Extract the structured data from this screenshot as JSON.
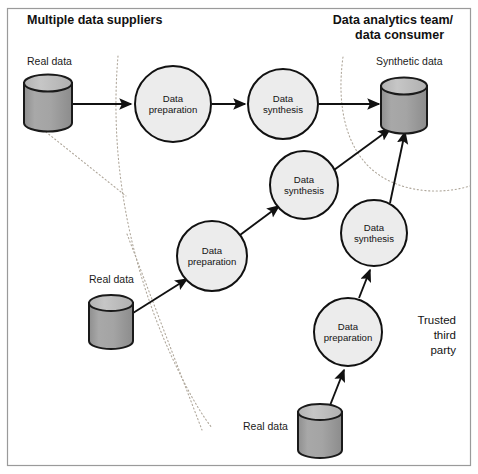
{
  "figure": {
    "title_left": "Multiple data suppliers",
    "title_right_line1": "Data analytics team/",
    "title_right_line2": "data consumer",
    "trusted_party_line1": "Trusted",
    "trusted_party_line2": "third",
    "trusted_party_line3": "party",
    "colors": {
      "border": "#9a9a9a",
      "stroke": "#111111",
      "circle_fill": "#ececec",
      "cylinder_top": "#bdbdbd",
      "cylinder_body": "#a2a2a2",
      "boundary_dotted": "#b0a89c",
      "background": "#ffffff"
    }
  },
  "datastores": [
    {
      "id": "real-data-top",
      "label": "Real data",
      "label_x": 27,
      "label_y": 65,
      "cx": 48,
      "cy_top": 83,
      "rx": 24,
      "ry": 8.5,
      "body_h": 40
    },
    {
      "id": "real-data-middle",
      "label": "Real data",
      "label_x": 89,
      "label_y": 283,
      "cx": 111,
      "cy_top": 303,
      "rx": 22,
      "ry": 8.0,
      "body_h": 38
    },
    {
      "id": "real-data-bottom",
      "label": "Real data",
      "label_x": 243,
      "label_y": 430,
      "cx": 320,
      "cy_top": 412,
      "rx": 22,
      "ry": 8.0,
      "body_h": 38
    },
    {
      "id": "synthetic-data",
      "label": "Synthetic data",
      "label_x": 376,
      "label_y": 65,
      "cx": 404,
      "cy_top": 86,
      "rx": 23,
      "ry": 8.5,
      "body_h": 39
    }
  ],
  "process_nodes": [
    {
      "id": "prep-1",
      "kind": "preparation",
      "line1": "Data",
      "line2": "preparation",
      "cx": 173,
      "cy": 104,
      "r": 38
    },
    {
      "id": "synth-1",
      "kind": "synthesis",
      "line1": "Data",
      "line2": "synthesis",
      "cx": 283,
      "cy": 104,
      "r": 35
    },
    {
      "id": "synth-2",
      "kind": "synthesis",
      "line1": "Data",
      "line2": "synthesis",
      "cx": 304,
      "cy": 185,
      "r": 34
    },
    {
      "id": "prep-2",
      "kind": "preparation",
      "line1": "Data",
      "line2": "preparation",
      "cx": 212,
      "cy": 256,
      "r": 35
    },
    {
      "id": "synth-3",
      "kind": "synthesis",
      "line1": "Data",
      "line2": "synthesis",
      "cx": 374,
      "cy": 233,
      "r": 33
    },
    {
      "id": "prep-3",
      "kind": "preparation",
      "line1": "Data",
      "line2": "preparation",
      "cx": 348,
      "cy": 332,
      "r": 34
    }
  ],
  "flow_arrows": [
    {
      "id": "arrow-realdata-top-to-prep1",
      "x1": 73,
      "y1": 104,
      "x2": 131,
      "y2": 104
    },
    {
      "id": "arrow-prep1-to-synth1",
      "x1": 212,
      "y1": 104,
      "x2": 245,
      "y2": 104
    },
    {
      "id": "arrow-synth1-to-synthetic",
      "x1": 319,
      "y1": 104,
      "x2": 379,
      "y2": 104
    },
    {
      "id": "arrow-realdata-mid-to-prep2",
      "x1": 133,
      "y1": 313,
      "x2": 187,
      "y2": 279
    },
    {
      "id": "arrow-prep2-to-synth2",
      "x1": 240,
      "y1": 235,
      "x2": 279,
      "y2": 205
    },
    {
      "id": "arrow-synth2-to-synthetic",
      "x1": 334,
      "y1": 170,
      "x2": 389,
      "y2": 128
    },
    {
      "id": "arrow-realdata-bot-to-prep3",
      "x1": 329,
      "y1": 406,
      "x2": 344,
      "y2": 369
    },
    {
      "id": "arrow-prep3-to-synth3",
      "x1": 359,
      "y1": 297,
      "x2": 370,
      "y2": 269
    },
    {
      "id": "arrow-synth3-to-synthetic",
      "x1": 389,
      "y1": 202,
      "x2": 404,
      "y2": 130
    }
  ],
  "boundaries": [
    {
      "id": "supplier-boundary-arc",
      "d": "M 118 56 C 110 150 124 265 184 382 C 194 402 203 416 212 428"
    },
    {
      "id": "supplier-divider-line",
      "d": "M 31 120 L 126 196"
    },
    {
      "id": "supplier-divider-line-2",
      "d": "M 127 234 L 202 430"
    },
    {
      "id": "consumer-boundary-arc",
      "d": "M 343 57 C 336 108 347 150 375 172 C 399 191 437 196 470 186"
    }
  ]
}
